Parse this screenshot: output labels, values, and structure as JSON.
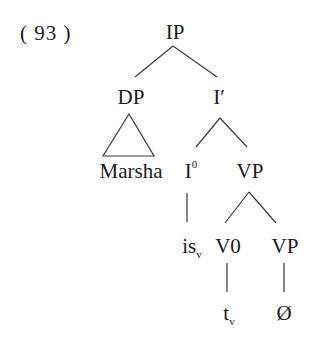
{
  "example_number": "( 93 )",
  "tree": {
    "nodes": {
      "ip": "IP",
      "dp": "DP",
      "ibar": "I′",
      "marsha": "Marsha",
      "i0_base": "I",
      "i0_sup": "0",
      "vp1": "VP",
      "is_base": "is",
      "is_sub": "v",
      "v0": "V0",
      "vp2": "VP",
      "t_base": "t",
      "t_sub": "v",
      "null": "Ø"
    },
    "structure": [
      {
        "parent": "IP",
        "children": [
          "DP",
          "I′"
        ]
      },
      {
        "parent": "DP",
        "children": [
          "Marsha"
        ],
        "edge": "triangle"
      },
      {
        "parent": "I′",
        "children": [
          "I0",
          "VP"
        ]
      },
      {
        "parent": "I0",
        "children": [
          "is_v"
        ]
      },
      {
        "parent": "VP",
        "children": [
          "V0",
          "VP"
        ]
      },
      {
        "parent": "V0",
        "children": [
          "t_v"
        ]
      },
      {
        "parent": "VP",
        "children": [
          "Ø"
        ]
      }
    ]
  },
  "colors": {
    "text": "#1a1a1a",
    "lines": "#3a3a3a",
    "background": "#ffffff"
  }
}
